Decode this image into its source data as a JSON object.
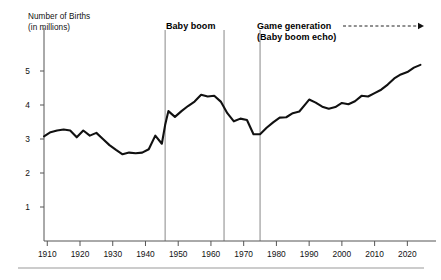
{
  "axis": {
    "y_title_line1": "Number of Births",
    "y_title_line2": "(in millions)",
    "y_ticks": [
      "1",
      "2",
      "3",
      "4",
      "5"
    ],
    "x_ticks": [
      "1910",
      "1920",
      "1930",
      "1940",
      "1950",
      "1960",
      "1970",
      "1980",
      "1990",
      "2000",
      "2010",
      "2020"
    ]
  },
  "annotations": {
    "baby_boom": "Baby boom",
    "game_generation": "Game generation",
    "baby_boom_echo": "(Baby boom echo)"
  },
  "colors": {
    "line": "#111111",
    "axis": "#555555",
    "marker_line": "#888888",
    "background": "#ffffff"
  },
  "chart_data": {
    "type": "line",
    "title": "",
    "xlabel": "",
    "ylabel": "Number of Births (in millions)",
    "xlim": [
      1909,
      2026
    ],
    "ylim": [
      0,
      5.6
    ],
    "grid": false,
    "legend": null,
    "series": [
      {
        "name": "Number of Births (millions)",
        "x": [
          1909,
          1911,
          1913,
          1915,
          1917,
          1919,
          1921,
          1923,
          1925,
          1927,
          1929,
          1931,
          1933,
          1935,
          1937,
          1939,
          1941,
          1943,
          1945,
          1946,
          1947,
          1949,
          1951,
          1953,
          1955,
          1957,
          1959,
          1961,
          1963,
          1965,
          1967,
          1969,
          1971,
          1973,
          1975,
          1977,
          1979,
          1981,
          1983,
          1985,
          1987,
          1989,
          1990,
          1992,
          1994,
          1996,
          1998,
          2000,
          2002,
          2004,
          2006,
          2008,
          2010,
          2012,
          2014,
          2016,
          2018,
          2020,
          2022,
          2024
        ],
        "y": [
          3.08,
          3.2,
          3.25,
          3.28,
          3.25,
          3.05,
          3.25,
          3.1,
          3.18,
          3.0,
          2.82,
          2.68,
          2.55,
          2.6,
          2.58,
          2.6,
          2.7,
          3.1,
          2.86,
          3.41,
          3.82,
          3.65,
          3.82,
          3.97,
          4.1,
          4.3,
          4.25,
          4.27,
          4.1,
          3.76,
          3.52,
          3.6,
          3.56,
          3.14,
          3.14,
          3.33,
          3.49,
          3.63,
          3.64,
          3.76,
          3.81,
          4.04,
          4.16,
          4.07,
          3.95,
          3.89,
          3.94,
          4.06,
          4.02,
          4.11,
          4.27,
          4.25,
          4.35,
          4.45,
          4.6,
          4.78,
          4.9,
          4.97,
          5.1,
          5.18
        ]
      }
    ],
    "markers": [
      {
        "label": "Baby boom start",
        "x": 1946
      },
      {
        "label": "Baby boom end",
        "x": 1964
      },
      {
        "label": "Game generation start",
        "x": 1975
      }
    ],
    "arrow": {
      "label": "Game generation",
      "from_x": 1982,
      "to_x": 2026,
      "style": "dashed"
    }
  }
}
